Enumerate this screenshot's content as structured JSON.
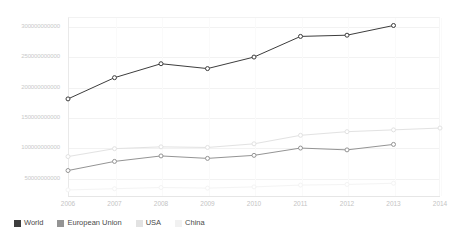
{
  "chart_data": {
    "type": "line",
    "title": "",
    "subtitle": "",
    "xlabel": "",
    "ylabel": "",
    "x": [
      2006,
      2007,
      2008,
      2009,
      2010,
      2011,
      2012,
      2013,
      2014
    ],
    "categories": [
      "2006",
      "2007",
      "2008",
      "2009",
      "2010",
      "2011",
      "2012",
      "2013",
      "2014"
    ],
    "xtick_labels": [
      "2006",
      "2007",
      "2008",
      "2009",
      "2010",
      "2011",
      "2012",
      "2013",
      "2014"
    ],
    "ytick_labels": [
      "50000000000",
      "100000000000",
      "150000000000",
      "200000000000",
      "250000000000",
      "300000000000"
    ],
    "ytick_values": [
      50000000000,
      100000000000,
      150000000000,
      200000000000,
      250000000000,
      300000000000
    ],
    "ylim": [
      20000000000,
      315000000000
    ],
    "xlim": [
      2006,
      2014
    ],
    "grid": true,
    "legend_position": "bottom-left",
    "series": [
      {
        "name": "World",
        "color": "#3d3d3d",
        "marker": "circle",
        "x": [
          2006,
          2007,
          2008,
          2009,
          2010,
          2011,
          2012,
          2013
        ],
        "values": [
          180000000000,
          215000000000,
          238000000000,
          230000000000,
          249000000000,
          283000000000,
          285000000000,
          301000000000
        ]
      },
      {
        "name": "European Union",
        "color": "#949494",
        "marker": "circle",
        "x": [
          2006,
          2007,
          2008,
          2009,
          2010,
          2011,
          2012,
          2013
        ],
        "values": [
          62000000000,
          77000000000,
          86000000000,
          82000000000,
          87000000000,
          99000000000,
          96000000000,
          105000000000
        ]
      },
      {
        "name": "USA",
        "color": "#e2e2e2",
        "marker": "circle",
        "x": [
          2006,
          2007,
          2008,
          2009,
          2010,
          2011,
          2012,
          2013,
          2014
        ],
        "values": [
          85000000000,
          98000000000,
          101000000000,
          100000000000,
          106000000000,
          120000000000,
          126000000000,
          129000000000,
          132000000000
        ]
      },
      {
        "name": "China",
        "color": "#f4f4f4",
        "marker": "circle",
        "x": [
          2006,
          2007,
          2008,
          2009,
          2010,
          2011,
          2012,
          2013
        ],
        "values": [
          30000000000,
          32000000000,
          34000000000,
          33000000000,
          35000000000,
          38000000000,
          39000000000,
          41000000000
        ]
      }
    ]
  },
  "legend": {
    "items": [
      {
        "label": "World",
        "color": "#3d3d3d"
      },
      {
        "label": "European Union",
        "color": "#949494"
      },
      {
        "label": "USA",
        "color": "#e2e2e2"
      },
      {
        "label": "China",
        "color": "#f1f1f1"
      }
    ]
  },
  "colors": {
    "background": "#ffffff",
    "gridline": "#f2f2f2",
    "axis": "#e6e6e6",
    "tick_text": "#c6c6c6",
    "legend_text": "#4a4a4a",
    "world": "#3d3d3d",
    "european_union": "#949494",
    "usa": "#e2e2e2",
    "china": "#f4f4f4"
  }
}
